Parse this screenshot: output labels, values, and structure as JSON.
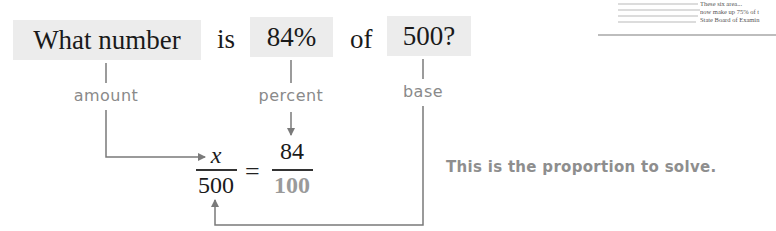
{
  "sentence": {
    "amount_box": "What number",
    "word_is": "is",
    "percent_box": "84%",
    "word_of": "of",
    "base_box": "500?"
  },
  "labels": {
    "amount": "amount",
    "percent": "percent",
    "base": "base"
  },
  "proportion": {
    "left_numerator": "x",
    "left_denominator": "500",
    "equals": "=",
    "right_numerator": "84",
    "right_denominator": "100"
  },
  "note": "This is the proportion to solve.",
  "doc_fragment": {
    "lines": [
      "These six area...",
      "now make up 75% of t",
      "State Board of Examin"
    ]
  },
  "colors": {
    "box_fill": "#ececec",
    "label_gray": "#8a8a8a",
    "connector_gray": "#7a7a7a",
    "denominator_gray": "#9a9a9a"
  }
}
